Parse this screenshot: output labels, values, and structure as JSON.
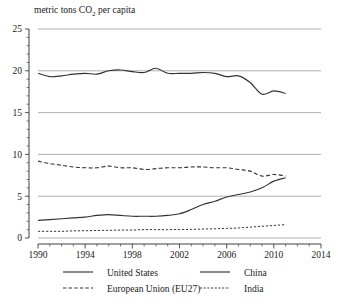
{
  "chart_data": {
    "type": "line",
    "title": "metric tons CO2 per capita",
    "title_display": "metric tons CO",
    "title_sub": "2",
    "title_tail": " per capita",
    "xlabel": "",
    "ylabel": "",
    "xlim": [
      1990,
      2014
    ],
    "ylim": [
      0,
      25
    ],
    "grid": true,
    "legend_position": "bottom",
    "x_ticks": [
      1990,
      1994,
      1998,
      2002,
      2006,
      2010,
      2014
    ],
    "x_tick_labels": [
      "1990",
      "1994",
      "1998",
      "2002",
      "2006",
      "2010",
      "2014"
    ],
    "y_ticks": [
      0,
      5,
      10,
      15,
      20,
      25
    ],
    "y_tick_labels": [
      "0",
      "5",
      "10",
      "15",
      "20",
      "25"
    ],
    "x_minor_step": 1,
    "y_minor_step": 1,
    "x": [
      1990,
      1991,
      1992,
      1993,
      1994,
      1995,
      1996,
      1997,
      1998,
      1999,
      2000,
      2001,
      2002,
      2003,
      2004,
      2005,
      2006,
      2007,
      2008,
      2009,
      2010,
      2011
    ],
    "series": [
      {
        "name": "United States",
        "style": "solid",
        "values": [
          19.7,
          19.3,
          19.4,
          19.6,
          19.7,
          19.6,
          20.0,
          20.1,
          19.9,
          19.8,
          20.3,
          19.7,
          19.7,
          19.7,
          19.8,
          19.7,
          19.3,
          19.4,
          18.6,
          17.2,
          17.6,
          17.3
        ]
      },
      {
        "name": "China",
        "style": "solid",
        "values": [
          2.1,
          2.2,
          2.3,
          2.4,
          2.5,
          2.7,
          2.8,
          2.7,
          2.6,
          2.6,
          2.6,
          2.7,
          2.9,
          3.4,
          4.0,
          4.4,
          4.9,
          5.2,
          5.5,
          6.0,
          6.8,
          7.2
        ]
      },
      {
        "name": "European Union (EU27)",
        "style": "dashed",
        "values": [
          9.2,
          8.9,
          8.7,
          8.5,
          8.4,
          8.4,
          8.6,
          8.4,
          8.4,
          8.2,
          8.3,
          8.4,
          8.4,
          8.5,
          8.5,
          8.4,
          8.4,
          8.2,
          8.0,
          7.4,
          7.6,
          7.4
        ]
      },
      {
        "name": "India",
        "style": "dotted",
        "values": [
          0.8,
          0.8,
          0.8,
          0.85,
          0.87,
          0.9,
          0.92,
          0.95,
          0.95,
          1.0,
          1.0,
          1.0,
          1.02,
          1.03,
          1.07,
          1.1,
          1.15,
          1.2,
          1.3,
          1.4,
          1.5,
          1.6
        ]
      }
    ]
  },
  "legend": {
    "items": [
      {
        "label": "United States",
        "style": "solid"
      },
      {
        "label": "China",
        "style": "solid"
      },
      {
        "label": "European Union (EU27)",
        "style": "dashed"
      },
      {
        "label": "India",
        "style": "dotted"
      }
    ]
  }
}
